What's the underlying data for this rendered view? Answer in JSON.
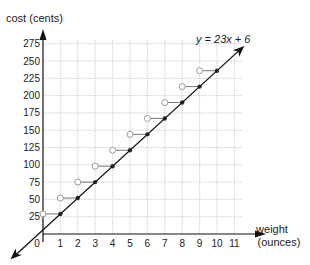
{
  "chart_data": {
    "type": "line",
    "title": "",
    "xlabel": "weight (ounces)",
    "xlabel_lines": [
      "weight",
      "(ounces)"
    ],
    "ylabel": "cost (cents)",
    "x_ticks": [
      1,
      2,
      3,
      4,
      5,
      6,
      7,
      8,
      9,
      10,
      11
    ],
    "y_ticks": [
      25,
      50,
      75,
      100,
      125,
      150,
      175,
      200,
      225,
      250,
      275
    ],
    "origin_label": "0",
    "xlim": [
      0,
      11
    ],
    "ylim": [
      0,
      275
    ],
    "grid": true,
    "equation_label": "y = 23x + 6",
    "series": [
      {
        "name": "y = 23x + 6",
        "kind": "line",
        "slope": 23,
        "intercept": 6,
        "x": [
          0,
          1,
          2,
          3,
          4,
          5,
          6,
          7,
          8,
          9,
          10,
          11
        ],
        "values": [
          6,
          29,
          52,
          75,
          98,
          121,
          144,
          167,
          190,
          213,
          236,
          259
        ]
      },
      {
        "name": "postage step function",
        "kind": "step",
        "segments": [
          {
            "x_open": 0,
            "x_closed": 1,
            "y": 29
          },
          {
            "x_open": 1,
            "x_closed": 2,
            "y": 52
          },
          {
            "x_open": 2,
            "x_closed": 3,
            "y": 75
          },
          {
            "x_open": 3,
            "x_closed": 4,
            "y": 98
          },
          {
            "x_open": 4,
            "x_closed": 5,
            "y": 121
          },
          {
            "x_open": 5,
            "x_closed": 6,
            "y": 144
          },
          {
            "x_open": 6,
            "x_closed": 7,
            "y": 167
          },
          {
            "x_open": 7,
            "x_closed": 8,
            "y": 190
          },
          {
            "x_open": 8,
            "x_closed": 9,
            "y": 213
          },
          {
            "x_open": 9,
            "x_closed": 10,
            "y": 236
          }
        ]
      }
    ]
  },
  "colors": {
    "axis": "#111111",
    "grid": "#c8c8c8",
    "line": "#111111",
    "step": "#777777",
    "open_circle": "#9a9a9a",
    "closed_dot": "#333333"
  }
}
